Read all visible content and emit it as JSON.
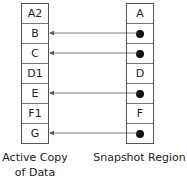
{
  "diagram": {
    "active_copy": {
      "label_line1": "Active Copy",
      "label_line2": "of Data",
      "cells": [
        "A2",
        "B",
        "C",
        "D1",
        "E",
        "F1",
        "G"
      ]
    },
    "snapshot_region": {
      "label": "Snapshot Region",
      "cells": [
        {
          "text": "A",
          "pointer": false
        },
        {
          "text": "",
          "pointer": true
        },
        {
          "text": "",
          "pointer": true
        },
        {
          "text": "D",
          "pointer": false
        },
        {
          "text": "",
          "pointer": true
        },
        {
          "text": "F",
          "pointer": false
        },
        {
          "text": "",
          "pointer": true
        }
      ]
    },
    "arrows": [
      {
        "from_row": 1,
        "to": "B"
      },
      {
        "from_row": 2,
        "to": "C"
      },
      {
        "from_row": 4,
        "to": "E"
      },
      {
        "from_row": 6,
        "to": "G"
      }
    ],
    "colors": {
      "line": "#555555",
      "dot": "#111111"
    }
  }
}
